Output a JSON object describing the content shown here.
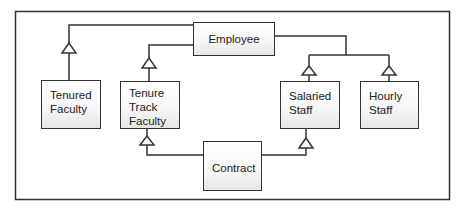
{
  "diagram": {
    "type": "uml-class-generalization",
    "colors": {
      "line": "#333333",
      "box_fill_top": "#ffffff",
      "box_fill_bottom": "#e6e6e6",
      "text": "#222222"
    },
    "classes": {
      "employee": "Employee",
      "tenured_faculty": "Tenured\nFaculty",
      "tenure_track_faculty": "Tenure\nTrack\nFaculty",
      "salaried_staff": "Salaried\nStaff",
      "hourly_staff": "Hourly\nStaff",
      "contract": "Contract"
    },
    "relationships": [
      {
        "from": "Tenured Faculty",
        "to": "Employee",
        "kind": "generalization"
      },
      {
        "from": "Tenure Track Faculty",
        "to": "Employee",
        "kind": "generalization"
      },
      {
        "from": "Salaried Staff",
        "to": "Employee",
        "kind": "generalization"
      },
      {
        "from": "Hourly Staff",
        "to": "Employee",
        "kind": "generalization"
      },
      {
        "from": "Contract",
        "to": "Tenure Track Faculty",
        "kind": "generalization"
      },
      {
        "from": "Contract",
        "to": "Salaried Staff",
        "kind": "generalization"
      }
    ]
  }
}
